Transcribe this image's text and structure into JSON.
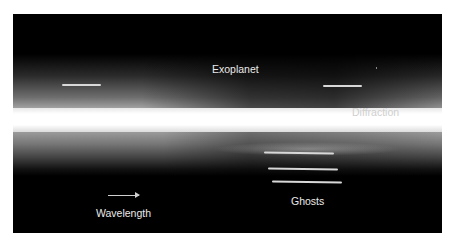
{
  "figure": {
    "background_color": "#000000",
    "border_color": "#ffffff"
  },
  "annotations": {
    "exoplanet": {
      "label": "Exoplanet"
    },
    "diffraction": {
      "label": "Diffraction"
    },
    "ghosts": {
      "label": "Ghosts"
    },
    "wavelength": {
      "label": "Wavelength",
      "arrow_direction": "right"
    }
  },
  "markers": {
    "exoplanet_left": {
      "x": 62,
      "y": 84,
      "length": 39
    },
    "exoplanet_right": {
      "x": 323,
      "y": 85,
      "length": 39
    },
    "ghost_lines": [
      {
        "x": 264,
        "y": 152,
        "length": 70
      },
      {
        "x": 268,
        "y": 168,
        "length": 70
      },
      {
        "x": 272,
        "y": 181,
        "length": 70
      }
    ]
  }
}
